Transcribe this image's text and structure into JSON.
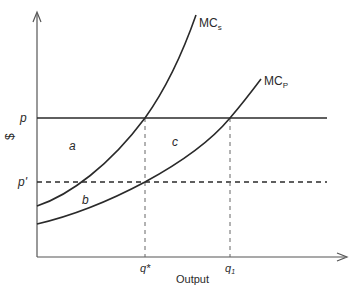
{
  "diagram": {
    "type": "economics-marginal-cost-diagram",
    "axes": {
      "y_label": "$",
      "x_label": "Output"
    },
    "price_levels": [
      {
        "label": "p",
        "style": "solid"
      },
      {
        "label": "p'",
        "style": "dashed"
      }
    ],
    "quantities": [
      {
        "label": "q*"
      },
      {
        "label": "q",
        "subscript": "1"
      }
    ],
    "curves": [
      {
        "label": "MC",
        "subscript": "s",
        "name": "social marginal cost"
      },
      {
        "label": "MC",
        "subscript": "P",
        "name": "private marginal cost"
      }
    ],
    "regions": [
      {
        "label": "a"
      },
      {
        "label": "b"
      },
      {
        "label": "c"
      }
    ],
    "colors": {
      "line": "#2a2a2a",
      "dashed": "#555555",
      "background": "#ffffff"
    }
  }
}
